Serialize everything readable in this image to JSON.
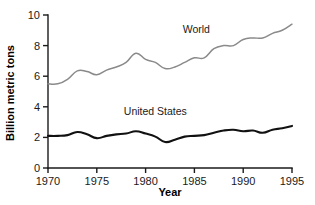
{
  "chart_data": {
    "type": "line",
    "title": "",
    "subtitle": "",
    "xlabel": "Year",
    "ylabel": "Billion metric tons",
    "xlim": [
      1970,
      1995
    ],
    "ylim": [
      0,
      10
    ],
    "grid": false,
    "legend_position": "inline-annotations",
    "xticks": [
      1970,
      1975,
      1980,
      1985,
      1990,
      1995
    ],
    "yticks": [
      0,
      2,
      4,
      6,
      8,
      10
    ],
    "xticklabels": [
      "1970",
      "1975",
      "1980",
      "1985",
      "1990",
      "1995"
    ],
    "yticklabels": [
      "0",
      "2",
      "4",
      "6",
      "8",
      "10"
    ],
    "x": [
      1970,
      1971,
      1972,
      1973,
      1974,
      1975,
      1976,
      1977,
      1978,
      1979,
      1980,
      1981,
      1982,
      1983,
      1984,
      1985,
      1986,
      1987,
      1988,
      1989,
      1990,
      1991,
      1992,
      1993,
      1994,
      1995
    ],
    "series": [
      {
        "name": "World",
        "color": "#8a8a8a",
        "values": [
          5.5,
          5.5,
          5.8,
          6.35,
          6.3,
          6.1,
          6.4,
          6.6,
          6.9,
          7.5,
          7.1,
          6.9,
          6.5,
          6.6,
          6.9,
          7.2,
          7.2,
          7.8,
          8.0,
          8.0,
          8.4,
          8.5,
          8.5,
          8.8,
          9.0,
          9.4
        ],
        "annotation": {
          "text": "World",
          "x": 1985.2,
          "y": 8.85
        }
      },
      {
        "name": "United States",
        "color": "#111111",
        "values": [
          2.1,
          2.1,
          2.15,
          2.35,
          2.2,
          1.95,
          2.1,
          2.2,
          2.25,
          2.4,
          2.25,
          2.05,
          1.7,
          1.85,
          2.05,
          2.1,
          2.15,
          2.3,
          2.45,
          2.5,
          2.4,
          2.45,
          2.3,
          2.5,
          2.6,
          2.75
        ],
        "annotation": {
          "text": "United States",
          "x": 1981.0,
          "y": 3.45
        }
      }
    ]
  }
}
